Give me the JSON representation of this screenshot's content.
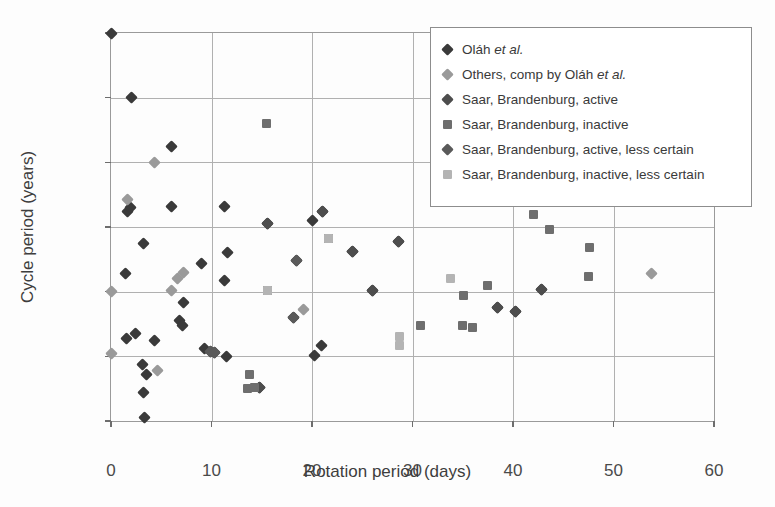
{
  "chart_data": {
    "type": "scatter",
    "title": "",
    "xlabel": "Rotation period (days)",
    "ylabel": "Cycle period (years)",
    "xlim": [
      0,
      60
    ],
    "ylim": [
      0,
      30
    ],
    "xticks": [
      0,
      10,
      20,
      30,
      40,
      50,
      60
    ],
    "yticks": [
      0,
      5,
      10,
      15,
      20,
      25,
      30
    ],
    "grid": true,
    "legend_position": "top-right",
    "series": [
      {
        "name": "Oláh et al.",
        "name_plain": "Olah et al.",
        "marker": "diamond",
        "color": "#3a3a3a",
        "points": [
          [
            0,
            30.0
          ],
          [
            2.0,
            25.0
          ],
          [
            6.0,
            21.2
          ],
          [
            1.6,
            16.2
          ],
          [
            1.9,
            16.5
          ],
          [
            6.0,
            16.6
          ],
          [
            11.3,
            16.6
          ],
          [
            15.6,
            15.3
          ],
          [
            20.0,
            15.5
          ],
          [
            21.0,
            16.2
          ],
          [
            3.2,
            13.7
          ],
          [
            11.6,
            13.0
          ],
          [
            24.0,
            13.1
          ],
          [
            28.6,
            13.9
          ],
          [
            1.4,
            11.4
          ],
          [
            9.0,
            12.2
          ],
          [
            18.5,
            12.4
          ],
          [
            11.3,
            10.9
          ],
          [
            26.0,
            10.1
          ],
          [
            42.8,
            10.2
          ],
          [
            7.2,
            9.2
          ],
          [
            38.5,
            8.8
          ],
          [
            40.2,
            8.5
          ],
          [
            18.2,
            8.0
          ],
          [
            6.8,
            7.8
          ],
          [
            7.1,
            7.4
          ],
          [
            1.5,
            6.4
          ],
          [
            2.4,
            6.8
          ],
          [
            4.3,
            6.2
          ],
          [
            20.9,
            5.8
          ],
          [
            9.3,
            5.6
          ],
          [
            9.9,
            5.4
          ],
          [
            10.3,
            5.3
          ],
          [
            11.5,
            5.0
          ],
          [
            20.2,
            5.1
          ],
          [
            3.1,
            4.4
          ],
          [
            3.5,
            3.6
          ],
          [
            3.2,
            2.2
          ],
          [
            3.3,
            0.3
          ],
          [
            14.8,
            2.6
          ]
        ]
      },
      {
        "name": "Others, comp by Oláh et al.",
        "name_plain": "Others, comp by Olah et al.",
        "marker": "diamond",
        "color": "#9a9a9a",
        "points": [
          [
            1.6,
            17.1
          ],
          [
            4.3,
            20.0
          ],
          [
            6.6,
            11.0
          ],
          [
            7.2,
            11.5
          ],
          [
            6.0,
            10.1
          ],
          [
            0.0,
            10.0
          ],
          [
            0.0,
            5.2
          ],
          [
            4.6,
            3.9
          ],
          [
            19.2,
            8.6
          ],
          [
            53.8,
            11.4
          ]
        ]
      },
      {
        "name": "Saar, Brandenburg, active",
        "marker": "diamond",
        "color": "#4d4d4d",
        "points": [
          [
            15.6,
            15.3
          ],
          [
            21.0,
            16.2
          ],
          [
            24.0,
            13.1
          ],
          [
            28.6,
            13.9
          ],
          [
            26.0,
            10.1
          ],
          [
            42.8,
            10.2
          ],
          [
            40.2,
            8.5
          ],
          [
            38.5,
            8.8
          ],
          [
            14.8,
            2.6
          ]
        ]
      },
      {
        "name": "Saar, Brandenburg, inactive",
        "marker": "square",
        "color": "#6e6e6e",
        "points": [
          [
            15.5,
            23.0
          ],
          [
            42.0,
            16.0
          ],
          [
            43.6,
            14.8
          ],
          [
            47.6,
            13.4
          ],
          [
            47.5,
            11.2
          ],
          [
            37.5,
            10.5
          ],
          [
            35.1,
            9.7
          ],
          [
            30.8,
            7.4
          ],
          [
            35.0,
            7.4
          ],
          [
            36.0,
            7.2
          ],
          [
            21.6,
            14.1
          ],
          [
            15.6,
            10.1
          ],
          [
            13.8,
            3.6
          ],
          [
            13.6,
            2.5
          ],
          [
            14.3,
            2.6
          ]
        ]
      },
      {
        "name": "Saar, Brandenburg, active, less certain",
        "marker": "diamond",
        "color": "#5a5a5a",
        "points": [
          [
            9.9,
            5.4
          ],
          [
            10.3,
            5.3
          ],
          [
            18.2,
            8.0
          ],
          [
            18.5,
            12.4
          ]
        ]
      },
      {
        "name": "Saar, Brandenburg, inactive, less certain",
        "marker": "square",
        "color": "#b4b4b4",
        "points": [
          [
            21.6,
            14.1
          ],
          [
            33.8,
            11.0
          ],
          [
            28.7,
            6.5
          ],
          [
            28.7,
            5.8
          ],
          [
            15.6,
            10.1
          ]
        ]
      }
    ],
    "legend": [
      {
        "label": "Oláh ",
        "italic": "et al.",
        "tail": "",
        "marker": "diamond",
        "color": "#3a3a3a"
      },
      {
        "label": "Others, comp by Oláh ",
        "italic": "et al.",
        "tail": "",
        "marker": "diamond",
        "color": "#9a9a9a"
      },
      {
        "label": "Saar, Brandenburg, active",
        "italic": "",
        "tail": "",
        "marker": "diamond",
        "color": "#4d4d4d"
      },
      {
        "label": "Saar, Brandenburg, inactive",
        "italic": "",
        "tail": "",
        "marker": "square",
        "color": "#6e6e6e"
      },
      {
        "label": "Saar, Brandenburg, active, less certain",
        "italic": "",
        "tail": "",
        "marker": "diamond",
        "color": "#5a5a5a"
      },
      {
        "label": "Saar, Brandenburg, inactive, less certain",
        "italic": "",
        "tail": "",
        "marker": "square",
        "color": "#b4b4b4"
      }
    ]
  }
}
